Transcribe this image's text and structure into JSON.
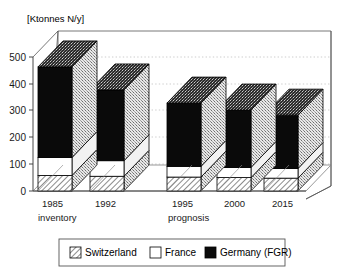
{
  "chart_data": {
    "type": "bar",
    "subtype": "stacked-3d-column",
    "title": "",
    "unit_label": "[Ktonnes N/y]",
    "xlabel": "",
    "ylabel": "",
    "ylim": [
      0,
      500
    ],
    "yticks": [
      0,
      100,
      200,
      300,
      400,
      500
    ],
    "ytick_labels": [
      "0",
      "100",
      "200",
      "300",
      "400",
      "500"
    ],
    "grid": "horizontal-dotted-back-wall",
    "legend_position": "below-plot",
    "categories": [
      "1985",
      "1992",
      "1995",
      "2000",
      "2015"
    ],
    "group_labels": [
      "inventory",
      "prognosis"
    ],
    "group_spans": [
      [
        "1985",
        "1992"
      ],
      [
        "1995",
        "2000",
        "2015"
      ]
    ],
    "series": [
      {
        "name": "Switzerland",
        "fill": "hatched",
        "values": [
          58,
          55,
          52,
          50,
          48
        ]
      },
      {
        "name": "France",
        "fill": "white",
        "values": [
          67,
          58,
          40,
          38,
          36
        ]
      },
      {
        "name": "Germany (FGR)",
        "fill": "black",
        "values": [
          338,
          264,
          236,
          214,
          199
        ]
      }
    ],
    "totals": [
      463,
      377,
      328,
      302,
      283
    ],
    "legend": [
      {
        "label": "Switzerland",
        "swatch": "hatched"
      },
      {
        "label": "France",
        "swatch": "white"
      },
      {
        "label": "Germany (FGR)",
        "swatch": "black"
      }
    ]
  },
  "colors": {
    "black_bar": "#0a0a0a",
    "white_bar": "#ffffff",
    "hatch_line": "#000000",
    "frame": "#555555",
    "grid": "#b8b8b8",
    "text": "#000000",
    "background": "#ffffff"
  },
  "axis": {
    "unit_label": "[Ktonnes N/y]",
    "tick_0": "0",
    "tick_100": "100",
    "tick_200": "200",
    "tick_300": "300",
    "tick_400": "400",
    "tick_500": "500"
  },
  "categories": {
    "c0": "1985",
    "c1": "1992",
    "c2": "1995",
    "c3": "2000",
    "c4": "2015"
  },
  "groups": {
    "g0": "inventory",
    "g1": "prognosis"
  },
  "legend": {
    "item0": "Switzerland",
    "item1": "France",
    "item2": "Germany (FGR)"
  }
}
